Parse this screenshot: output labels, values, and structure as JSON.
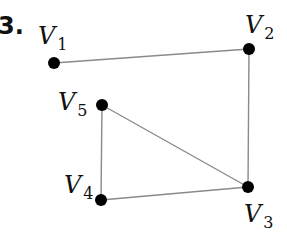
{
  "problem_number": "3.",
  "graph": {
    "nodes": [
      {
        "id": "V1",
        "letter": "V",
        "sub": "1",
        "x": 54,
        "y": 63,
        "lx": 38,
        "ly": 44
      },
      {
        "id": "V2",
        "letter": "V",
        "sub": "2",
        "x": 249,
        "y": 49,
        "lx": 245,
        "ly": 33
      },
      {
        "id": "V3",
        "letter": "V",
        "sub": "3",
        "x": 248,
        "y": 187,
        "lx": 244,
        "ly": 222
      },
      {
        "id": "V4",
        "letter": "V",
        "sub": "4",
        "x": 101,
        "y": 200,
        "lx": 64,
        "ly": 193
      },
      {
        "id": "V5",
        "letter": "V",
        "sub": "5",
        "x": 102,
        "y": 105,
        "lx": 58,
        "ly": 110
      }
    ],
    "edges": [
      [
        "V1",
        "V2"
      ],
      [
        "V2",
        "V3"
      ],
      [
        "V5",
        "V3"
      ],
      [
        "V5",
        "V4"
      ],
      [
        "V4",
        "V3"
      ]
    ],
    "colors": {
      "edge": "#8a8a8a",
      "node": "#000000"
    }
  }
}
